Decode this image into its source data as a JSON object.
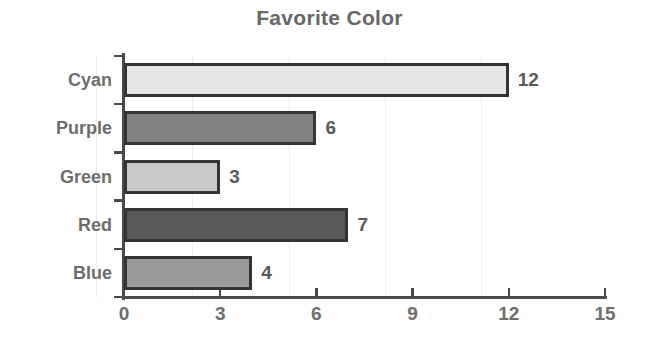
{
  "chart_data": {
    "type": "bar",
    "orientation": "horizontal",
    "title": "Favorite Color",
    "xlabel": "",
    "ylabel": "",
    "categories": [
      "Cyan",
      "Purple",
      "Green",
      "Red",
      "Blue"
    ],
    "values": [
      12,
      6,
      3,
      7,
      4
    ],
    "value_labels": [
      "12",
      "6",
      "3",
      "7",
      "4"
    ],
    "xlim": [
      0,
      15
    ],
    "x_ticks": [
      0,
      3,
      6,
      9,
      12,
      15
    ],
    "x_tick_labels": [
      "0",
      "3",
      "6",
      "9",
      "12",
      "15"
    ],
    "grid": true,
    "grid_axis": "x",
    "legend": false,
    "bar_colors": [
      "#e6e6e6",
      "#828282",
      "#c9c9c9",
      "#595959",
      "#9a9a9a"
    ],
    "bar_border_color": "#343434",
    "axis_color": "#4a4a4a",
    "grid_color": "#efefef",
    "title_color": "#676767",
    "label_color": "#6d6d6d",
    "value_color": "#5a5a5a",
    "background_color": "#ffffff"
  }
}
